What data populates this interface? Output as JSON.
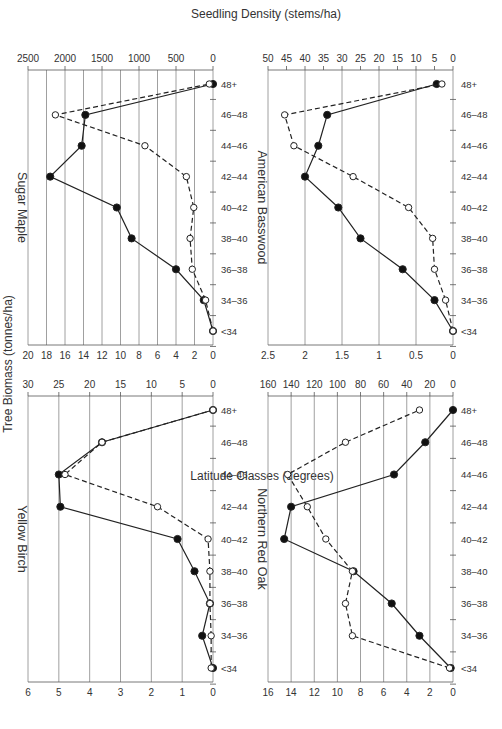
{
  "figure": {
    "rotation": "90deg clockwise",
    "left_axis_label": "Tree Biomass (tonnes/ha)",
    "right_axis_label": "Seedling Density (stems/ha)",
    "x_axis_label": "Latitude Classes (degrees)"
  },
  "chart_data": [
    {
      "type": "line",
      "title": "Sugar Maple",
      "categories": [
        "<34",
        "34–36",
        "36–38",
        "38–40",
        "40–42",
        "42–44",
        "44–46",
        "46–48",
        "48+"
      ],
      "xlabel": "Latitude Classes (degrees)",
      "series": [
        {
          "name": "Tree Biomass (tonnes/ha)",
          "marker": "filled-circle",
          "line": "solid",
          "axis": "left",
          "values": [
            0,
            1.0,
            4.0,
            8.8,
            10.4,
            17.6,
            14.2,
            13.8,
            0
          ]
        },
        {
          "name": "Seedling Density (stems/ha)",
          "marker": "open-circle",
          "line": "dashed",
          "axis": "right",
          "values": [
            0,
            100,
            280,
            310,
            260,
            360,
            920,
            2130,
            50
          ]
        }
      ],
      "ylim_left": [
        0,
        20
      ],
      "yticks_left": [
        0,
        2,
        4,
        6,
        8,
        10,
        12,
        14,
        16,
        18,
        20
      ],
      "ylim_right": [
        0,
        2500
      ],
      "yticks_right": [
        0,
        500,
        1000,
        1500,
        2000,
        2500
      ],
      "grid": true
    },
    {
      "type": "line",
      "title": "American Basswood",
      "categories": [
        "<34",
        "34–36",
        "36–38",
        "38–40",
        "40–42",
        "42–44",
        "44–46",
        "46–48",
        "48+"
      ],
      "xlabel": "Latitude Classes (degrees)",
      "series": [
        {
          "name": "Tree Biomass (tonnes/ha)",
          "marker": "filled-circle",
          "line": "solid",
          "axis": "left",
          "values": [
            0,
            0.25,
            0.68,
            1.25,
            1.55,
            2.0,
            1.82,
            1.7,
            0.22
          ]
        },
        {
          "name": "Seedling Density (stems/ha)",
          "marker": "open-circle",
          "line": "dashed",
          "axis": "right",
          "values": [
            0,
            2,
            5,
            5.5,
            12,
            27,
            43,
            45.5,
            3
          ]
        }
      ],
      "ylim_left": [
        0,
        2.5
      ],
      "yticks_left": [
        0,
        0.5,
        1,
        1.5,
        2,
        2.5
      ],
      "ylim_right": [
        0,
        50
      ],
      "yticks_right": [
        0,
        5,
        10,
        15,
        20,
        25,
        30,
        35,
        40,
        45,
        50
      ],
      "grid": true
    },
    {
      "type": "line",
      "title": "Yellow Birch",
      "categories": [
        "<34",
        "34–36",
        "36–38",
        "38–40",
        "40–42",
        "42–44",
        "44–46",
        "46–48",
        "48+"
      ],
      "xlabel": "Latitude Classes (degrees)",
      "series": [
        {
          "name": "Tree Biomass (tonnes/ha)",
          "marker": "filled-circle",
          "line": "solid",
          "axis": "left",
          "values": [
            0,
            0.35,
            0.1,
            0.6,
            1.15,
            4.95,
            5.0,
            3.6,
            0
          ]
        },
        {
          "name": "Seedling Density (stems/ha)",
          "marker": "open-circle",
          "line": "dashed",
          "axis": "right",
          "values": [
            0.3,
            0.3,
            0.5,
            0.5,
            0.8,
            9,
            24,
            18,
            0
          ]
        }
      ],
      "ylim_left": [
        0,
        6
      ],
      "yticks_left": [
        0,
        1,
        2,
        3,
        4,
        5,
        6
      ],
      "ylim_right": [
        0,
        30
      ],
      "yticks_right": [
        0,
        5,
        10,
        15,
        20,
        25,
        30
      ],
      "grid": true
    },
    {
      "type": "line",
      "title": "Northern Red Oak",
      "categories": [
        "<34",
        "34–36",
        "36–38",
        "38–40",
        "40–42",
        "42–44",
        "44–46",
        "46–48",
        "48+"
      ],
      "xlabel": "Latitude Classes (degrees)",
      "series": [
        {
          "name": "Tree Biomass (tonnes/ha)",
          "marker": "filled-circle",
          "line": "solid",
          "axis": "left",
          "values": [
            0.2,
            2.9,
            5.3,
            8.6,
            14.6,
            14.0,
            5.1,
            2.4,
            0
          ]
        },
        {
          "name": "Seedling Density (stems/ha)",
          "marker": "open-circle",
          "line": "dashed",
          "axis": "right",
          "values": [
            3,
            87,
            93,
            87,
            110,
            126,
            143,
            93,
            29
          ]
        }
      ],
      "ylim_left": [
        0,
        16
      ],
      "yticks_left": [
        0,
        2,
        4,
        6,
        8,
        10,
        12,
        14,
        16
      ],
      "ylim_right": [
        0,
        160
      ],
      "yticks_right": [
        0,
        20,
        40,
        60,
        80,
        100,
        120,
        140,
        160
      ],
      "grid": true
    }
  ]
}
